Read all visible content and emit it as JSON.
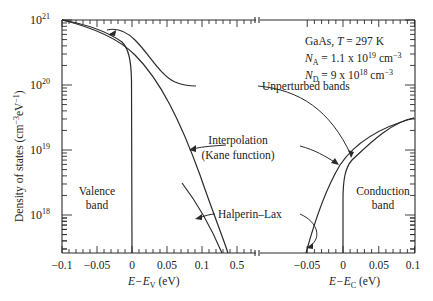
{
  "chart_data": {
    "type": "line",
    "title": "",
    "annotation_box": {
      "line1": "GaAs, T = 297 K",
      "line2": "N_A = 1.1 x 10^19 cm^-3",
      "line3": "N_D = 9 x 10^18 cm^-3"
    },
    "ylabel": "Density of states  (cm^-3 eV^-1)",
    "yscale": "log",
    "ylim": [
      2.6e+17,
      1e+21
    ],
    "yticks": [
      "10^18",
      "10^19",
      "10^20",
      "10^21"
    ],
    "x_axes": [
      {
        "name": "valence",
        "xlabel": "E−E_V (eV)",
        "xlim": [
          -0.1,
          0.16
        ],
        "ticks": [
          "-0.1",
          "-0.05",
          "0",
          "0.05",
          "0.1",
          "0.5"
        ]
      },
      {
        "name": "conduction",
        "xlabel": "E−E_C (eV)",
        "xlim": [
          -0.055,
          0.1
        ],
        "ticks": [
          "-0.05",
          "0",
          "0.05",
          "0.1"
        ]
      }
    ],
    "series": [
      {
        "name": "Unperturbed bands (valence)",
        "axis": "valence",
        "points": [
          [
            -0.1,
            1e+21
          ],
          [
            -0.08,
            8.9e+20
          ],
          [
            -0.06,
            7.6e+20
          ],
          [
            -0.04,
            6.2e+20
          ],
          [
            -0.02,
            4.5e+20
          ],
          [
            -0.005,
            2.5e+20
          ],
          [
            -0.001,
            8e+19
          ],
          [
            0.0,
            2.6e+17
          ]
        ]
      },
      {
        "name": "Interpolation (Kane function) (valence)",
        "axis": "valence",
        "points": [
          [
            -0.1,
            1e+21
          ],
          [
            -0.06,
            7.9e+20
          ],
          [
            -0.02,
            5e+20
          ],
          [
            0.0,
            3.6e+20
          ],
          [
            0.03,
            1.8e+20
          ],
          [
            0.06,
            7e+19
          ],
          [
            0.08,
            2.7e+19
          ],
          [
            0.1,
            5.5e+18
          ],
          [
            0.12,
            8e+17
          ],
          [
            0.13,
            2.6e+17
          ]
        ]
      },
      {
        "name": "Halperin-Lax (valence)",
        "axis": "valence",
        "points": [
          [
            0.07,
            8e+18
          ],
          [
            0.09,
            3.5e+18
          ],
          [
            0.1,
            1.8e+18
          ],
          [
            0.11,
            8e+17
          ],
          [
            0.12,
            2.6e+17
          ]
        ]
      },
      {
        "name": "Unperturbed bands (valence, shifted)",
        "axis": "valence",
        "points": [
          [
            -0.05,
            6.8e+20
          ],
          [
            -0.035,
            6.5e+20
          ],
          [
            -0.02,
            5.5e+20
          ],
          [
            0.0,
            3.6e+20
          ],
          [
            0.03,
            1.9e+20
          ],
          [
            0.05,
            1.25e+20
          ],
          [
            0.06,
            1.1e+20
          ]
        ]
      },
      {
        "name": "Unperturbed bands (conduction)",
        "axis": "conduction",
        "points": [
          [
            0.0,
            2.6e+17
          ],
          [
            0.0005,
            3e+18
          ],
          [
            0.003,
            7e+18
          ],
          [
            0.01,
            1.3e+19
          ],
          [
            0.02,
            1.8e+19
          ],
          [
            0.05,
            2.6e+19
          ],
          [
            0.1,
            3.4e+19
          ]
        ]
      },
      {
        "name": "Interpolation (Kane function) (conduction)",
        "axis": "conduction",
        "points": [
          [
            -0.051,
            2.6e+17
          ],
          [
            -0.04,
            1e+18
          ],
          [
            -0.025,
            3e+18
          ],
          [
            -0.01,
            7.5e+18
          ],
          [
            0.0,
            1.15e+19
          ],
          [
            0.01,
            1.5e+19
          ],
          [
            0.02,
            1.8e+19
          ],
          [
            0.05,
            2.6e+19
          ],
          [
            0.1,
            3.4e+19
          ]
        ]
      }
    ],
    "annotations": [
      {
        "text": "Unperturbed bands"
      },
      {
        "text": "Interpolation"
      },
      {
        "text": "(Kane function)"
      },
      {
        "text": "Halperin–Lax"
      },
      {
        "text": "Valence"
      },
      {
        "text": "band"
      },
      {
        "text": "Conduction"
      },
      {
        "text": "band"
      }
    ],
    "grid": false,
    "legend": "none"
  },
  "labels": {
    "y_axis": "Density of states  (cm",
    "y_tick_1e21": "10",
    "y_tick_1e20": "10",
    "y_tick_1e19": "10",
    "y_tick_1e18": "10",
    "exp21": "21",
    "exp20": "20",
    "exp19": "19",
    "exp18": "18",
    "xv_ticks": [
      "−0.1",
      "−0.05",
      "0",
      "0.05",
      "0.1",
      "0.5"
    ],
    "xc_ticks": [
      "−0.05",
      "0",
      "0.05",
      "0.1"
    ],
    "xv_label_E": "E−E",
    "xv_label_sub": "V",
    "xv_label_unit": " (eV)",
    "xc_label_E": "E−E",
    "xc_label_sub": "C",
    "xc_label_unit": " (eV)",
    "box_gaas": "GaAs, ",
    "box_T": "T",
    "box_temp": " = 297 K",
    "box_NA_N": "N",
    "box_NA_sub": "A",
    "box_NA_val": " = 1.1 x 10",
    "box_NA_exp": "19",
    "box_NA_unit": " cm",
    "box_ND_N": "N",
    "box_ND_sub": "D",
    "box_ND_val": " = 9 x 10",
    "box_ND_exp": "18",
    "box_ND_unit": " cm",
    "neg3": "−3",
    "unperturbed": "Unperturbed bands",
    "interp1": "Interpolation",
    "interp2": "(Kane function)",
    "halperin": "Halperin–Lax",
    "valence1": "Valence",
    "valence2": "band",
    "conduction1": "Conduction",
    "conduction2": "band",
    "ylab_main": "Density of states  (cm",
    "ylab_exp1": "−3",
    "ylab_mid": "eV",
    "ylab_exp2": "−1",
    "ylab_end": ")"
  },
  "colors": {
    "line": "#2a2a2a",
    "background": "#ffffff"
  }
}
